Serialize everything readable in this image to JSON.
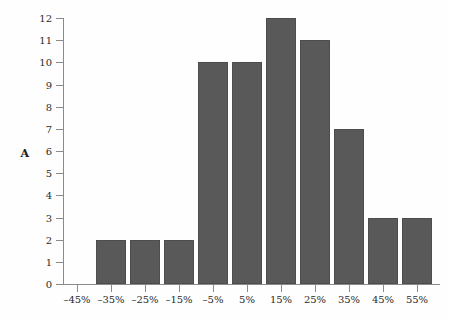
{
  "chart": {
    "y_axis_label": "A",
    "background_color": "#fefefe",
    "bar_color": "#595959",
    "bar_border_color": "#4d4d4d",
    "axis_color": "#8a8a8a",
    "text_color": "#2b2b2b"
  },
  "chart_data": {
    "type": "bar",
    "title": "",
    "subtitle": "",
    "xlabel": "",
    "ylabel": "A",
    "categories": [
      "–45%",
      "–35%",
      "–25%",
      "–15%",
      "–5%",
      "5%",
      "15%",
      "25%",
      "35%",
      "45%",
      "55%"
    ],
    "values": [
      0,
      2,
      2,
      2,
      10,
      10,
      12,
      11,
      7,
      3,
      3
    ],
    "ylim": [
      0,
      12
    ],
    "ytick_labels": [
      "0",
      "1",
      "2",
      "3",
      "4",
      "5",
      "6",
      "7",
      "8",
      "9",
      "10",
      "11",
      "12"
    ],
    "ytick_values": [
      0,
      1,
      2,
      3,
      4,
      5,
      6,
      7,
      8,
      9,
      10,
      11,
      12
    ],
    "grid": false,
    "legend": null,
    "legend_position": "none",
    "annotations": []
  }
}
